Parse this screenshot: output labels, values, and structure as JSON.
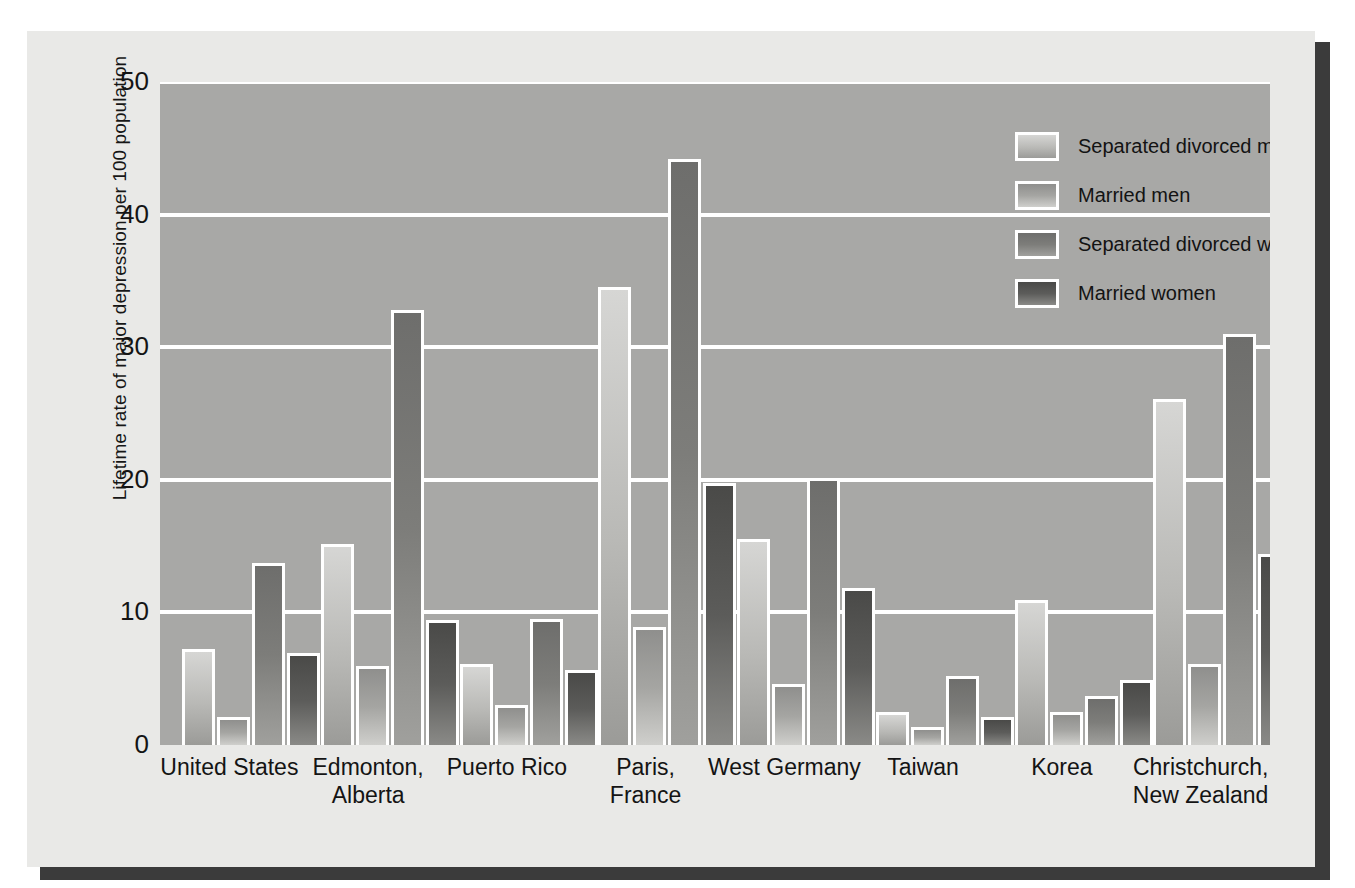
{
  "chart_data": {
    "type": "bar",
    "title": "",
    "xlabel": "",
    "ylabel": "Lifetime rate of major depression per 100 population",
    "ylim": [
      0,
      50
    ],
    "yticks": [
      0,
      10,
      20,
      30,
      40,
      50
    ],
    "ytick_labels": [
      "0",
      "10",
      "20",
      "30",
      "40",
      "50"
    ],
    "grid": true,
    "legend_position": "upper right",
    "categories": [
      "United States",
      "Edmonton,\nAlberta",
      "Puerto Rico",
      "Paris,\nFrance",
      "West Germany",
      "Taiwan",
      "Korea",
      "Christchurch,\nNew Zealand"
    ],
    "series": [
      {
        "name": "Separated divorced men",
        "color": "#c9c9c6",
        "values": [
          7.0,
          14.9,
          5.9,
          34.3,
          15.3,
          2.3,
          10.7,
          25.9
        ]
      },
      {
        "name": "Married men",
        "color": "#a3a3a0",
        "values": [
          1.9,
          5.7,
          2.8,
          8.7,
          4.4,
          1.1,
          2.3,
          5.9
        ]
      },
      {
        "name": "Separated divorced women",
        "color": "#7a7a78",
        "values": [
          13.5,
          32.6,
          9.3,
          44.0,
          19.9,
          5.0,
          3.5,
          30.8
        ]
      },
      {
        "name": "Married women",
        "color": "#515150",
        "values": [
          6.7,
          9.2,
          5.4,
          19.5,
          11.6,
          1.9,
          4.7,
          14.2
        ]
      }
    ]
  },
  "palette": {
    "page_background": "#ffffff",
    "card_background": "#e9e9e7",
    "card_shadow": "#3b3b3b",
    "plot_background": "#a8a8a6",
    "gridline": "#ffffff",
    "text": "#141414"
  }
}
